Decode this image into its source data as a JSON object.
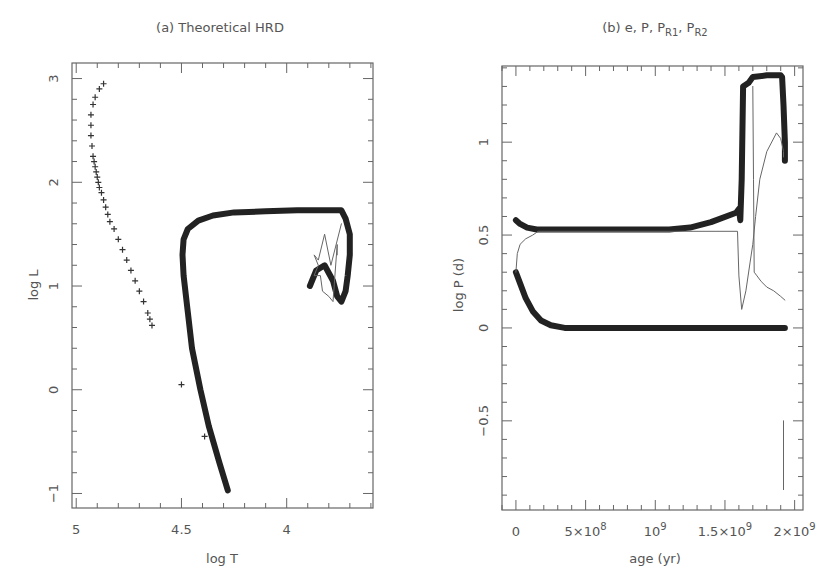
{
  "chart_data": [
    {
      "type": "scatter",
      "panel": "a",
      "title": "(a) Theoretical HRD",
      "xlabel": "log T",
      "ylabel": "log L",
      "xlim": [
        5.02,
        3.59
      ],
      "ylim": [
        -1.14,
        3.15
      ],
      "x_inverted": true,
      "grid": false,
      "xticks": [
        5,
        4.5,
        4
      ],
      "xtick_labels": [
        "5",
        "4.5",
        "4"
      ],
      "yticks": [
        -1,
        0,
        1,
        2,
        3
      ],
      "ytick_labels": [
        "−1",
        "0",
        "1",
        "2",
        "3"
      ],
      "series": [
        {
          "name": "primary track (thick)",
          "style": "thick",
          "x": [
            4.28,
            4.32,
            4.37,
            4.41,
            4.45,
            4.47,
            4.49,
            4.495,
            4.49,
            4.47,
            4.42,
            4.35,
            4.25,
            4.1,
            3.95,
            3.8,
            3.74,
            3.72,
            3.7,
            3.7,
            3.71,
            3.72,
            3.74,
            3.76,
            3.78,
            3.82,
            3.86,
            3.89
          ],
          "y": [
            -0.97,
            -0.7,
            -0.35,
            0.0,
            0.4,
            0.75,
            1.1,
            1.3,
            1.45,
            1.55,
            1.63,
            1.68,
            1.71,
            1.72,
            1.73,
            1.73,
            1.73,
            1.65,
            1.5,
            1.3,
            1.1,
            0.95,
            0.85,
            0.9,
            1.05,
            1.2,
            1.15,
            1.0
          ]
        },
        {
          "name": "secondary track (thin)",
          "style": "thin",
          "x": [
            3.74,
            3.79,
            3.82,
            3.85,
            3.87,
            3.85,
            3.87,
            3.84,
            3.83,
            3.8,
            3.78,
            3.76,
            3.76
          ],
          "y": [
            1.6,
            1.2,
            1.5,
            1.25,
            1.3,
            1.2,
            1.1,
            1.1,
            0.95,
            0.9,
            0.85,
            1.4,
            1.3
          ]
        },
        {
          "name": "companion (plus markers)",
          "style": "plus",
          "x": [
            4.87,
            4.89,
            4.91,
            4.92,
            4.93,
            4.93,
            4.93,
            4.925,
            4.92,
            4.915,
            4.91,
            4.905,
            4.9,
            4.895,
            4.89,
            4.88,
            4.87,
            4.86,
            4.85,
            4.84,
            4.82,
            4.8,
            4.78,
            4.76,
            4.74,
            4.72,
            4.7,
            4.68,
            4.66,
            4.65,
            4.64,
            4.5,
            4.39
          ],
          "y": [
            2.95,
            2.9,
            2.82,
            2.75,
            2.65,
            2.55,
            2.45,
            2.35,
            2.25,
            2.2,
            2.15,
            2.1,
            2.05,
            2.0,
            1.95,
            1.9,
            1.83,
            1.76,
            1.69,
            1.62,
            1.55,
            1.45,
            1.35,
            1.25,
            1.15,
            1.05,
            0.95,
            0.85,
            0.74,
            0.68,
            0.62,
            0.05,
            -0.45
          ]
        }
      ]
    },
    {
      "type": "line",
      "panel": "b",
      "title": "(b) e, P, P",
      "title_sub1": "R1",
      "title_sep": ", P",
      "title_sub2": "R2",
      "xlabel": "age (yr)",
      "ylabel": "log P (d)",
      "xlim": [
        -100000000.0,
        2060000000.0
      ],
      "ylim": [
        -0.98,
        1.41
      ],
      "grid": false,
      "xticks": [
        0,
        500000000.0,
        1000000000.0,
        1500000000.0,
        2000000000.0
      ],
      "xtick_labels": [
        {
          "base": "0",
          "exp": ""
        },
        {
          "base": "5×10",
          "exp": "8"
        },
        {
          "base": "10",
          "exp": "9"
        },
        {
          "base": "1.5×10",
          "exp": "9"
        },
        {
          "base": "2×10",
          "exp": "9"
        }
      ],
      "yticks": [
        -0.5,
        0,
        0.5,
        1
      ],
      "ytick_labels": [
        "−0.5",
        "0",
        "0.5",
        "1"
      ],
      "series": [
        {
          "name": "P (orbital period)",
          "style": "thick",
          "x": [
            0,
            30000000.0,
            80000000.0,
            150000000.0,
            300000000.0,
            600000000.0,
            900000000.0,
            1100000000.0,
            1250000000.0,
            1400000000.0,
            1580000000.0,
            1600000000.0,
            1610000000.0,
            1620000000.0,
            1630000000.0,
            1670000000.0,
            1700000000.0,
            1800000000.0,
            1900000000.0,
            1910000000.0,
            1920000000.0,
            1930000000.0,
            1930000000.0
          ],
          "y": [
            0.58,
            0.56,
            0.54,
            0.53,
            0.53,
            0.53,
            0.53,
            0.53,
            0.54,
            0.57,
            0.62,
            0.64,
            0.58,
            0.8,
            1.3,
            1.32,
            1.35,
            1.36,
            1.36,
            1.35,
            1.2,
            1.0,
            0.9
          ]
        },
        {
          "name": "P_R1",
          "style": "thick",
          "x": [
            0,
            30000000.0,
            70000000.0,
            120000000.0,
            180000000.0,
            250000000.0,
            350000000.0,
            500000000.0,
            800000000.0,
            1200000000.0,
            1600000000.0,
            1900000000.0,
            1930000000.0
          ],
          "y": [
            0.3,
            0.24,
            0.16,
            0.09,
            0.04,
            0.015,
            0.0,
            0.0,
            0.0,
            0.0,
            0.0,
            0.0,
            0.0
          ]
        },
        {
          "name": "e / P_R2 (thin)",
          "style": "thin",
          "x": [
            0,
            10000000.0,
            30000000.0,
            70000000.0,
            120000000.0,
            160000000.0,
            1590000000.0,
            1600000000.0,
            1620000000.0,
            1650000000.0,
            1680000000.0,
            1700000000.0,
            1720000000.0,
            1750000000.0,
            1800000000.0,
            1870000000.0,
            1900000000.0,
            1920000000.0,
            1920000000.0
          ],
          "y": [
            0.3,
            0.4,
            0.45,
            0.48,
            0.5,
            0.52,
            0.52,
            0.28,
            0.1,
            0.2,
            0.35,
            0.45,
            0.6,
            0.8,
            0.95,
            1.05,
            1.02,
            0.95,
            0.92
          ]
        },
        {
          "name": "P_R2 (thin, secondary)",
          "style": "thin",
          "x": [
            1700000000.0,
            1705000000.0,
            1710000000.0,
            1730000000.0,
            1760000000.0,
            1800000000.0,
            1850000000.0,
            1900000000.0,
            1930000000.0
          ],
          "y": [
            1.3,
            0.8,
            0.3,
            0.28,
            0.25,
            0.22,
            0.2,
            0.17,
            0.15
          ]
        },
        {
          "name": "final drop (thin vertical)",
          "style": "thin",
          "x": [
            1920000000.0,
            1920000000.0
          ],
          "y": [
            -0.5,
            -0.87
          ]
        }
      ]
    }
  ],
  "layout": {
    "panels": [
      {
        "frame": {
          "left": 72,
          "top": 63,
          "right": 373,
          "bottom": 508
        }
      },
      {
        "frame": {
          "left": 502,
          "top": 66,
          "right": 803,
          "bottom": 510
        }
      }
    ]
  }
}
